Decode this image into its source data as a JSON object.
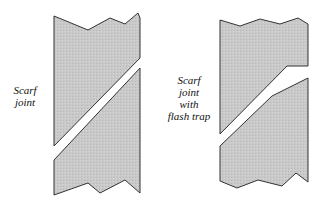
{
  "figures": [
    {
      "label_lines": [
        "Scarf",
        "joint"
      ],
      "fill": "#c8c8c8",
      "stroke": "#333333"
    },
    {
      "label_lines": [
        "Scarf",
        "joint",
        "with",
        "flash trap"
      ],
      "fill": "#c8c8c8",
      "stroke": "#333333"
    }
  ]
}
